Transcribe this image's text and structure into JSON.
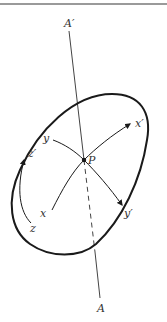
{
  "figure": {
    "axis": {
      "top_label": "A′",
      "bottom_label": "A"
    },
    "point": {
      "label": "P"
    },
    "frame_original": {
      "x_label": "x",
      "y_label": "y",
      "z_label": "z"
    },
    "frame_rotated": {
      "x_label": "x′",
      "y_label": "y′",
      "z_label": "z′"
    },
    "colors": {
      "stroke": "#1a1a1a",
      "axis": "#444444",
      "rule": "#9a9a9a"
    }
  }
}
